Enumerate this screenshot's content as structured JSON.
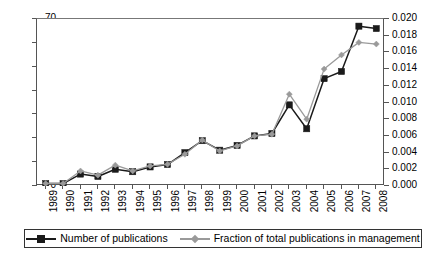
{
  "chart_data": {
    "type": "line",
    "title": "",
    "xlabel": "",
    "ylabel": "",
    "grid": false,
    "legend_position": "bottom",
    "categories": [
      "1989",
      "1990",
      "1991",
      "1992",
      "1993",
      "1994",
      "1995",
      "1996",
      "1997",
      "1998",
      "1999",
      "2000",
      "2001",
      "2002",
      "2003",
      "2004",
      "2005",
      "2006",
      "2007",
      "2008"
    ],
    "axes": {
      "left": {
        "label": "",
        "ylim": [
          0,
          70
        ],
        "ticks": [
          0,
          10,
          20,
          30,
          40,
          50,
          60,
          70
        ],
        "tick_labels": [
          "0",
          "10",
          "20",
          "30",
          "40",
          "50",
          "60",
          "70"
        ]
      },
      "right": {
        "label": "",
        "ylim": [
          0.0,
          0.02
        ],
        "ticks": [
          0.0,
          0.002,
          0.004,
          0.006,
          0.008,
          0.01,
          0.012,
          0.014,
          0.016,
          0.018,
          0.02
        ],
        "tick_labels": [
          "0.000",
          "0.002",
          "0.004",
          "0.006",
          "0.008",
          "0.010",
          "0.012",
          "0.014",
          "0.016",
          "0.018",
          "0.020"
        ]
      }
    },
    "series": [
      {
        "name": "Number of publications",
        "axis": "left",
        "color": "#1a1a1a",
        "marker": "square",
        "values": [
          1,
          1,
          5,
          4,
          7,
          6,
          8,
          9,
          14,
          19,
          15,
          17,
          21,
          22,
          34,
          24,
          45,
          48,
          67,
          66
        ]
      },
      {
        "name": "Fraction of total publications in management",
        "axis": "right",
        "color": "#9a9a9a",
        "marker": "diamond",
        "values": [
          0.0003,
          0.0003,
          0.0018,
          0.0013,
          0.0025,
          0.0018,
          0.0024,
          0.0026,
          0.0038,
          0.0055,
          0.0042,
          0.0048,
          0.006,
          0.0062,
          0.011,
          0.008,
          0.014,
          0.0157,
          0.0172,
          0.017
        ]
      }
    ]
  },
  "legend": {
    "entries": [
      {
        "label": "Number of publications",
        "marker": "square-marker",
        "color": "#1a1a1a"
      },
      {
        "label": "Fraction of total publications in management",
        "marker": "diamond-marker",
        "color": "#9a9a9a"
      }
    ]
  }
}
